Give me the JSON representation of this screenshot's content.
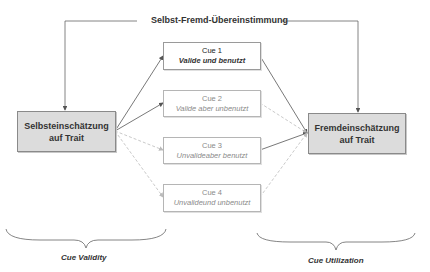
{
  "diagram": {
    "title": "Selbst-Fremd-Übereinstimmung",
    "left_node": {
      "line1": "Selbsteinschätzung",
      "line2": "auf Trait"
    },
    "right_node": {
      "line1": "Fremdeinschätzung",
      "line2": "auf Trait"
    },
    "cues": [
      {
        "label": "Cue 1",
        "desc": "Valide und benutzt"
      },
      {
        "label": "Cue 2",
        "desc": "Valide aber unbenutzt"
      },
      {
        "label": "Cue 3",
        "desc": "Unvalideaber benutzt"
      },
      {
        "label": "Cue 4",
        "desc": "Unvalideund unbenutzt"
      }
    ],
    "bottom_labels": {
      "left": "Cue Validity",
      "right": "Cue Utilization"
    },
    "colors": {
      "node_fill": "#dcdcdc",
      "line_solid": "#555555",
      "line_dashed": "#bbbbbb"
    }
  }
}
